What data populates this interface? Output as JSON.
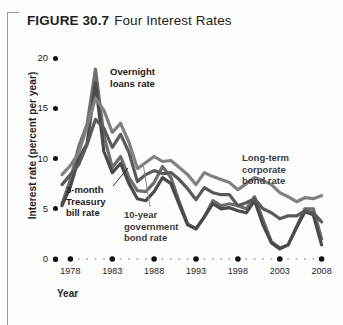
{
  "figure": {
    "number": "FIGURE 30.7",
    "name": "Four Interest Rates"
  },
  "chart_data": {
    "type": "line",
    "title": "Four Interest Rates",
    "xlabel": "Year",
    "ylabel": "Interest rate (percent per year)",
    "xlim": [
      1977,
      2009
    ],
    "ylim": [
      0,
      20
    ],
    "yticks": [
      "0",
      "5",
      "10",
      "15",
      "20"
    ],
    "ytick_values": [
      0,
      5,
      10,
      15,
      20
    ],
    "xticks": [
      "1978",
      "1983",
      "1988",
      "1993",
      "1998",
      "2003",
      "2008"
    ],
    "xtick_values": [
      1978,
      1983,
      1988,
      1993,
      1998,
      2003,
      2008
    ],
    "grid": false,
    "legend": "annotations-inline",
    "x": [
      1977,
      1978,
      1979,
      1980,
      1981,
      1982,
      1983,
      1984,
      1985,
      1986,
      1987,
      1988,
      1989,
      1990,
      1991,
      1992,
      1993,
      1994,
      1995,
      1996,
      1997,
      1998,
      1999,
      2000,
      2001,
      2002,
      2003,
      2004,
      2005,
      2006,
      2007,
      2008
    ],
    "series": [
      {
        "name": "Overnight loans rate",
        "color": "#6e6e6e",
        "values": [
          5.5,
          7.9,
          11.2,
          13.4,
          18.9,
          12.3,
          9.1,
          10.2,
          8.1,
          6.8,
          6.7,
          7.6,
          9.2,
          8.1,
          5.7,
          3.5,
          3.0,
          4.2,
          5.8,
          5.3,
          5.5,
          5.3,
          5.0,
          6.2,
          3.9,
          1.7,
          1.1,
          1.4,
          3.2,
          5.0,
          5.0,
          2.0
        ]
      },
      {
        "name": "3-month Treasury bill rate",
        "color": "#4a4a4a",
        "values": [
          5.3,
          7.2,
          10.0,
          11.5,
          17.5,
          10.7,
          8.6,
          9.5,
          7.5,
          6.0,
          5.8,
          6.7,
          8.1,
          7.5,
          5.4,
          3.4,
          3.0,
          4.2,
          5.5,
          5.0,
          5.1,
          4.8,
          4.6,
          5.8,
          3.4,
          1.6,
          1.0,
          1.4,
          3.1,
          4.7,
          4.4,
          1.4
        ]
      },
      {
        "name": "10-year government bond rate",
        "color": "#5a5a5a",
        "values": [
          7.4,
          8.4,
          9.4,
          11.4,
          13.9,
          13.0,
          11.1,
          12.4,
          10.6,
          7.7,
          8.4,
          8.8,
          8.5,
          8.6,
          7.9,
          7.0,
          5.9,
          7.1,
          6.6,
          6.4,
          6.4,
          5.3,
          5.6,
          6.0,
          5.0,
          4.6,
          4.0,
          4.3,
          4.3,
          4.8,
          4.6,
          3.7
        ]
      },
      {
        "name": "Long-term corporate bond rate",
        "color": "#808080",
        "values": [
          8.4,
          9.3,
          10.6,
          13.2,
          16.0,
          14.8,
          12.6,
          13.5,
          11.6,
          9.0,
          9.6,
          10.2,
          9.7,
          9.8,
          9.1,
          8.4,
          7.4,
          8.6,
          8.2,
          7.9,
          7.6,
          6.9,
          7.5,
          8.1,
          7.8,
          7.4,
          6.6,
          6.2,
          5.7,
          6.1,
          6.0,
          6.3
        ]
      }
    ],
    "annotations": [
      {
        "id": "overnight",
        "text": "Overnight\nloans rate"
      },
      {
        "id": "tbill",
        "text": "3-month\nTreasury\nbill rate"
      },
      {
        "id": "govbond",
        "text": "10-year\ngovernment\nbond rate"
      },
      {
        "id": "corpbond",
        "text": "Long-term\ncorporate\nbond rate"
      }
    ]
  }
}
